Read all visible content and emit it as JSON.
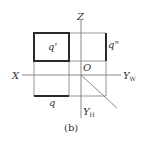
{
  "diagram": {
    "caption": "(b)",
    "axes": {
      "z_label": "Z",
      "x_label": "X",
      "yw_label": "Y",
      "yw_sub": "W",
      "yh_label": "Y",
      "yh_sub": "H",
      "origin_label": "O"
    },
    "projections": {
      "front_label": "q'",
      "side_label": "q\"",
      "top_label": "q"
    },
    "colors": {
      "line": "#8a8a8a",
      "bold": "#2a2a2a",
      "text": "#333333"
    }
  }
}
